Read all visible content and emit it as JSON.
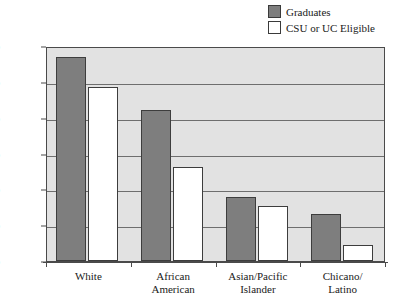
{
  "chart_data": {
    "type": "bar",
    "title": "",
    "subtitle": "",
    "xlabel": "",
    "ylabel": "",
    "ylim": [
      0,
      300
    ],
    "yticks": [
      0,
      50,
      100,
      150,
      200,
      250,
      300
    ],
    "ytick_labels": [
      "0",
      "50",
      "100",
      "150",
      "200",
      "250",
      "300"
    ],
    "grid": true,
    "grid_axis": "y",
    "legend_position": "top-right",
    "categories": [
      "White",
      "African American",
      "Asian/Pacific Islander",
      "Chicano/Latino"
    ],
    "category_lines": [
      [
        "White"
      ],
      [
        "African",
        "American"
      ],
      [
        "Asian/Pacific",
        "Islander"
      ],
      [
        "Chicano/",
        "Latino"
      ]
    ],
    "series": [
      {
        "name": "Graduates",
        "color": "#7e7e7e",
        "values": [
          285,
          211,
          90,
          66
        ]
      },
      {
        "name": "CSU or UC Eligible",
        "color": "#ffffff",
        "values": [
          243,
          131,
          77,
          23
        ]
      }
    ],
    "plot_background": "#e2e2e2",
    "axis_color": "#4a4a4a",
    "gridline_color": "#6e6e6e"
  },
  "legend": {
    "items": [
      {
        "label": "Graduates",
        "swatch": "#7e7e7e"
      },
      {
        "label": "CSU or UC Eligible",
        "swatch": "#ffffff"
      }
    ]
  }
}
